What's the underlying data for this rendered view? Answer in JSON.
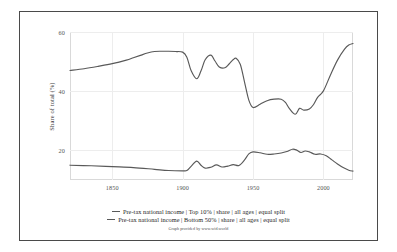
{
  "chart_data": {
    "type": "line",
    "title": "",
    "subtitle": "",
    "xlabel": "",
    "ylabel": "Share of total (%)",
    "xlim": [
      1820,
      2021
    ],
    "ylim": [
      10,
      60
    ],
    "grid": true,
    "xticks": [
      "1850",
      "1900",
      "1950",
      "2000"
    ],
    "xtick_values": [
      1850,
      1900,
      1950,
      2000
    ],
    "yticks": [
      "20",
      "40",
      "60"
    ],
    "ytick_values": [
      20,
      40,
      60
    ],
    "legend_position": "bottom",
    "attribution": "Graph provided by www.wid.world",
    "series": [
      {
        "name": "Pre-tax national income | Top 10% | share | all ages | equal split",
        "color": "#595959",
        "x": [
          1820,
          1830,
          1840,
          1850,
          1860,
          1865,
          1870,
          1875,
          1880,
          1885,
          1890,
          1895,
          1900,
          1903,
          1906,
          1910,
          1913,
          1916,
          1920,
          1923,
          1926,
          1930,
          1933,
          1936,
          1938,
          1941,
          1944,
          1947,
          1950,
          1955,
          1960,
          1965,
          1970,
          1973,
          1976,
          1980,
          1983,
          1986,
          1990,
          1993,
          1996,
          2000,
          2005,
          2010,
          2015,
          2018,
          2021
        ],
        "y": [
          47.0,
          47.6,
          48.4,
          49.3,
          50.5,
          51.3,
          52.1,
          52.9,
          53.4,
          53.5,
          53.5,
          53.4,
          53.2,
          51.5,
          47.0,
          44.2,
          46.8,
          50.6,
          52.2,
          50.2,
          48.2,
          47.9,
          49.2,
          50.7,
          51.1,
          49.0,
          43.0,
          37.0,
          34.5,
          35.6,
          36.8,
          37.3,
          37.3,
          36.2,
          34.0,
          32.2,
          34.2,
          33.6,
          34.0,
          35.5,
          38.0,
          40.1,
          45.5,
          50.5,
          54.2,
          55.6,
          56.1
        ]
      },
      {
        "name": "Pre-tax national income | Bottom 50% | share | all ages | equal split",
        "color": "#595959",
        "x": [
          1820,
          1835,
          1850,
          1865,
          1880,
          1890,
          1900,
          1903,
          1906,
          1910,
          1913,
          1916,
          1920,
          1924,
          1928,
          1932,
          1936,
          1940,
          1944,
          1947,
          1950,
          1955,
          1960,
          1965,
          1970,
          1974,
          1978,
          1981,
          1984,
          1987,
          1990,
          1994,
          1998,
          2002,
          2006,
          2010,
          2014,
          2018,
          2021
        ],
        "y": [
          15.0,
          14.8,
          14.5,
          14.2,
          13.6,
          13.2,
          13.1,
          13.2,
          14.6,
          16.4,
          15.0,
          14.0,
          14.3,
          15.1,
          14.4,
          14.7,
          15.2,
          14.9,
          16.8,
          18.8,
          19.5,
          19.2,
          18.7,
          18.8,
          19.1,
          19.6,
          20.4,
          20.1,
          19.3,
          19.8,
          19.5,
          18.7,
          18.8,
          18.2,
          16.8,
          15.4,
          14.2,
          13.3,
          13.0
        ]
      }
    ]
  },
  "legend": {
    "items": [
      {
        "label": "Pre-tax national income | Top 10% | share | all ages | equal split"
      },
      {
        "label": "Pre-tax national income | Bottom 50% | share | all ages | equal split"
      }
    ]
  }
}
